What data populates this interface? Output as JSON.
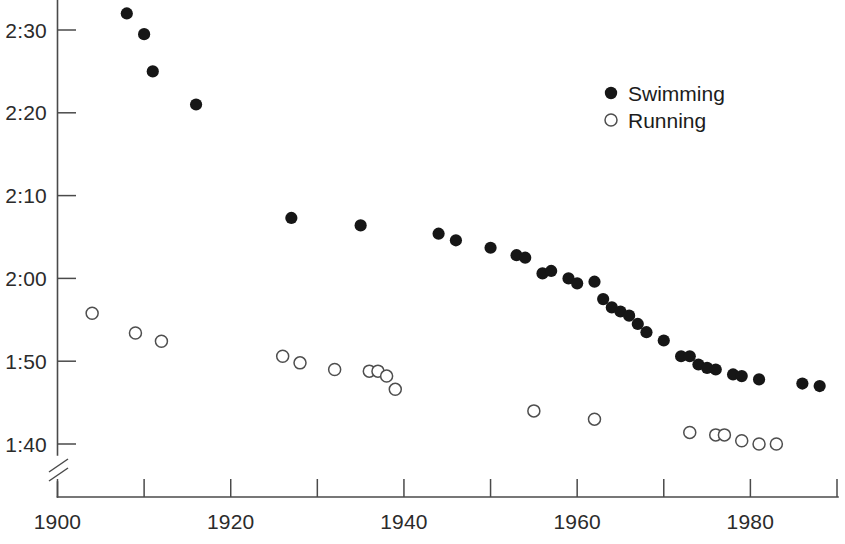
{
  "chart_data": {
    "type": "scatter",
    "title": "",
    "subtitle": "",
    "xlabel": "",
    "ylabel": "",
    "xlim": [
      1900,
      1992
    ],
    "ylim_seconds": [
      97,
      153
    ],
    "grid": false,
    "y_axis_break": true,
    "y_axis_break_note": "axis broken below 1:40",
    "legend_position": "top-right",
    "x_ticks_major": [
      1900,
      1920,
      1940,
      1960,
      1980
    ],
    "x_ticks_minor": [
      1910,
      1930,
      1950,
      1970,
      1990
    ],
    "x_tick_labels": [
      "1900",
      "1920",
      "1940",
      "1960",
      "1980"
    ],
    "y_ticks": [
      150,
      140,
      130,
      120,
      110,
      100
    ],
    "y_tick_labels": [
      "2:30",
      "2:20",
      "2:10",
      "2:00",
      "1:50",
      "1:40"
    ],
    "series": [
      {
        "name": "Swimming",
        "marker": "filled-circle",
        "color": "#161616",
        "points": [
          {
            "x": 1908,
            "y": 152.0,
            "label": "2:32.0"
          },
          {
            "x": 1910,
            "y": 149.5,
            "label": "2:29.5"
          },
          {
            "x": 1911,
            "y": 145.0,
            "label": "2:25.0"
          },
          {
            "x": 1916,
            "y": 141.0,
            "label": "2:21.0"
          },
          {
            "x": 1927,
            "y": 127.3,
            "label": "2:07.3"
          },
          {
            "x": 1935,
            "y": 126.4,
            "label": "2:06.4"
          },
          {
            "x": 1944,
            "y": 125.4,
            "label": "2:05.4"
          },
          {
            "x": 1946,
            "y": 124.6,
            "label": "2:04.6"
          },
          {
            "x": 1950,
            "y": 123.7,
            "label": "2:03.7"
          },
          {
            "x": 1953,
            "y": 122.8,
            "label": "2:02.8"
          },
          {
            "x": 1954,
            "y": 122.5,
            "label": "2:02.5"
          },
          {
            "x": 1956,
            "y": 120.6,
            "label": "2:00.6"
          },
          {
            "x": 1957,
            "y": 120.9,
            "label": "2:00.9"
          },
          {
            "x": 1959,
            "y": 120.0,
            "label": "2:00.0"
          },
          {
            "x": 1960,
            "y": 119.4,
            "label": "1:59.4"
          },
          {
            "x": 1962,
            "y": 119.6,
            "label": "1:59.6"
          },
          {
            "x": 1963,
            "y": 117.5,
            "label": "1:57.5"
          },
          {
            "x": 1964,
            "y": 116.5,
            "label": "1:56.5"
          },
          {
            "x": 1965,
            "y": 116.0,
            "label": "1:56.0"
          },
          {
            "x": 1966,
            "y": 115.5,
            "label": "1:55.5"
          },
          {
            "x": 1967,
            "y": 114.5,
            "label": "1:54.5"
          },
          {
            "x": 1968,
            "y": 113.5,
            "label": "1:53.5"
          },
          {
            "x": 1970,
            "y": 112.5,
            "label": "1:52.5"
          },
          {
            "x": 1972,
            "y": 110.6,
            "label": "1:50.6"
          },
          {
            "x": 1973,
            "y": 110.6,
            "label": "1:50.6"
          },
          {
            "x": 1974,
            "y": 109.6,
            "label": "1:49.6"
          },
          {
            "x": 1975,
            "y": 109.2,
            "label": "1:49.2"
          },
          {
            "x": 1976,
            "y": 109.0,
            "label": "1:49.0"
          },
          {
            "x": 1978,
            "y": 108.4,
            "label": "1:48.4"
          },
          {
            "x": 1979,
            "y": 108.2,
            "label": "1:48.2"
          },
          {
            "x": 1981,
            "y": 107.8,
            "label": "1:47.8"
          },
          {
            "x": 1986,
            "y": 107.3,
            "label": "1:47.3"
          },
          {
            "x": 1988,
            "y": 107.0,
            "label": "1:47.0"
          }
        ]
      },
      {
        "name": "Running",
        "marker": "open-circle",
        "color": "#4e4e4e",
        "points": [
          {
            "x": 1904,
            "y": 115.8,
            "label": "1:55.8"
          },
          {
            "x": 1909,
            "y": 113.4,
            "label": "1:53.4"
          },
          {
            "x": 1912,
            "y": 112.4,
            "label": "1:52.4"
          },
          {
            "x": 1926,
            "y": 110.6,
            "label": "1:50.6"
          },
          {
            "x": 1928,
            "y": 109.8,
            "label": "1:49.8"
          },
          {
            "x": 1932,
            "y": 109.0,
            "label": "1:49.0"
          },
          {
            "x": 1936,
            "y": 108.8,
            "label": "1:48.8"
          },
          {
            "x": 1937,
            "y": 108.8,
            "label": "1:48.8"
          },
          {
            "x": 1938,
            "y": 108.2,
            "label": "1:48.2"
          },
          {
            "x": 1939,
            "y": 106.6,
            "label": "1:46.6"
          },
          {
            "x": 1955,
            "y": 104.0,
            "label": "1:44.0"
          },
          {
            "x": 1962,
            "y": 103.0,
            "label": "1:43.0"
          },
          {
            "x": 1973,
            "y": 101.4,
            "label": "1:41.4"
          },
          {
            "x": 1976,
            "y": 101.1,
            "label": "1:41.1"
          },
          {
            "x": 1977,
            "y": 101.1,
            "label": "1:41.1"
          },
          {
            "x": 1979,
            "y": 100.4,
            "label": "1:40.4"
          },
          {
            "x": 1981,
            "y": 100.0,
            "label": "1:40.0"
          },
          {
            "x": 1983,
            "y": 100.0,
            "label": "1:40.0"
          }
        ]
      }
    ]
  },
  "legend": {
    "entries": [
      {
        "label": "Swimming",
        "marker": "filled-circle"
      },
      {
        "label": "Running",
        "marker": "open-circle"
      }
    ]
  }
}
